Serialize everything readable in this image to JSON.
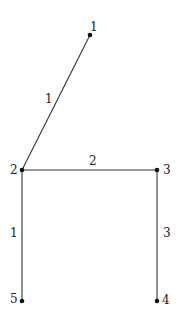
{
  "diagram": {
    "type": "graph",
    "nodes": [
      {
        "id": "1",
        "label": "1",
        "x": 90,
        "y": 35
      },
      {
        "id": "2",
        "label": "2",
        "x": 22,
        "y": 170
      },
      {
        "id": "3",
        "label": "3",
        "x": 157,
        "y": 170
      },
      {
        "id": "4",
        "label": "4",
        "x": 157,
        "y": 301
      },
      {
        "id": "5",
        "label": "5",
        "x": 22,
        "y": 301
      }
    ],
    "edges": [
      {
        "from": "1",
        "to": "2",
        "weight": "1"
      },
      {
        "from": "2",
        "to": "3",
        "weight": "2"
      },
      {
        "from": "3",
        "to": "4",
        "weight": "3"
      },
      {
        "from": "2",
        "to": "5",
        "weight": "1"
      }
    ],
    "colors": {
      "edge": "#333333",
      "node": "#111111",
      "background": "#ffffff"
    }
  }
}
